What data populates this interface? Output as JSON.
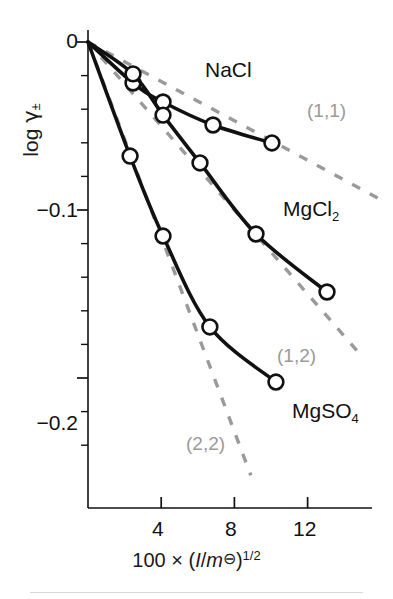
{
  "figure": {
    "background": "#ffffff",
    "ink_color": "#111111",
    "limiting_law_color": "#9a9a9a"
  },
  "axes": {
    "y_title_prefix": "log ",
    "y_title_symbol": "γ",
    "y_title_subscript": "±",
    "y_ticks_labeled": [
      "0",
      "−0.1",
      "−0.2"
    ],
    "y_tick_values": [
      0,
      -0.1,
      -0.2
    ],
    "x_ticks_labeled": [
      "4",
      "8",
      "12"
    ],
    "x_tick_values": [
      4,
      8,
      12
    ],
    "x_title_parts": {
      "lead": "100  ×  (",
      "italic_I": "I",
      "slash": "/",
      "italic_m": "m",
      "standard_state": "⊖",
      "close": ")",
      "exponent": "1/2"
    },
    "x_title_plain": "100 × (I/m⊖)^1/2"
  },
  "chart_data": {
    "type": "line",
    "title": "",
    "subtitle": "",
    "xlabel": "100 × (I/m⊖)^1/2",
    "ylabel": "log γ±",
    "xlim": [
      0,
      16.6
    ],
    "ylim": [
      -0.26,
      0.012
    ],
    "grid": false,
    "legend_position": "inline-right-of-curve",
    "marker": "open-circle",
    "series": [
      {
        "name": "NaCl",
        "label": "NaCl",
        "charge_type": "(1,1)",
        "color": "#111111",
        "points": [
          {
            "x": 0.0,
            "y": 0.0
          },
          {
            "x": 2.46,
            "y": -0.0244
          },
          {
            "x": 4.1,
            "y": -0.0357
          },
          {
            "x": 6.83,
            "y": -0.0494
          },
          {
            "x": 10.05,
            "y": -0.0601
          }
        ]
      },
      {
        "name": "MgCl2",
        "label": "MgCl",
        "label_subscript": "2",
        "charge_type": "(1,2)",
        "color": "#111111",
        "points": [
          {
            "x": 0.0,
            "y": 0.0
          },
          {
            "x": 2.46,
            "y": -0.019
          },
          {
            "x": 4.1,
            "y": -0.0435
          },
          {
            "x": 6.12,
            "y": -0.072
          },
          {
            "x": 9.18,
            "y": -0.1143
          },
          {
            "x": 13.06,
            "y": -0.1488
          }
        ]
      },
      {
        "name": "MgSO4",
        "label": "MgSO",
        "label_subscript": "4",
        "charge_type": "(2,2)",
        "color": "#111111",
        "points": [
          {
            "x": 0.0,
            "y": 0.0
          },
          {
            "x": 2.3,
            "y": -0.0679
          },
          {
            "x": 4.1,
            "y": -0.1155
          },
          {
            "x": 6.66,
            "y": -0.1696
          },
          {
            "x": 10.27,
            "y": -0.2024
          }
        ]
      }
    ],
    "limiting_laws": [
      {
        "label": "(1,1)",
        "charge_product": 1,
        "style": "dashed",
        "color": "#9a9a9a",
        "from": {
          "x": 0.0,
          "y": 0.0
        },
        "to": {
          "x": 16.2,
          "y": -0.095
        }
      },
      {
        "label": "(1,2)",
        "charge_product": 2,
        "style": "dashed",
        "color": "#9a9a9a",
        "from": {
          "x": 0.0,
          "y": 0.0
        },
        "to": {
          "x": 14.8,
          "y": -0.185
        }
      },
      {
        "label": "(2,2)",
        "charge_product": 4,
        "style": "dashed",
        "color": "#9a9a9a",
        "from": {
          "x": 0.0,
          "y": 0.0
        },
        "to": {
          "x": 8.9,
          "y": -0.258
        }
      }
    ]
  },
  "annotations": {
    "series_labels": [
      {
        "text": "NaCl",
        "x": 205,
        "y": 70
      },
      {
        "text": "MgCl",
        "sub": "2",
        "x": 283,
        "y": 209
      },
      {
        "text": "MgSO",
        "sub": "4",
        "x": 292,
        "y": 411
      }
    ],
    "limiting_law_labels": [
      {
        "text": "(1,1)",
        "x": 307,
        "y": 110
      },
      {
        "text": "(1,2)",
        "x": 277,
        "y": 355
      },
      {
        "text": "(2,2)",
        "x": 186,
        "y": 443
      }
    ]
  }
}
